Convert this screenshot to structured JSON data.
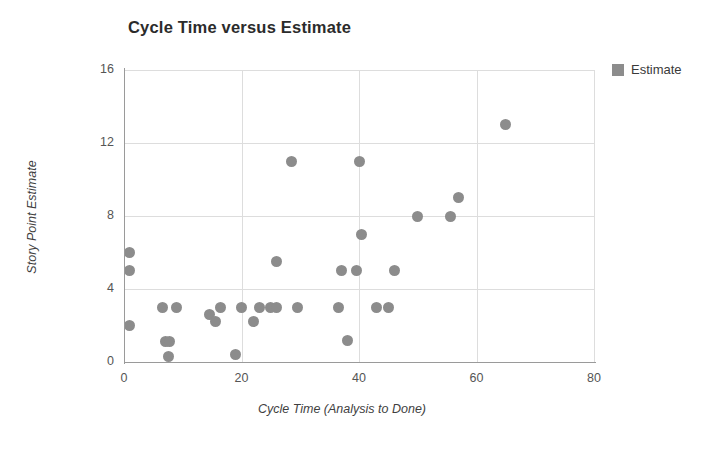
{
  "chart_data": {
    "type": "scatter",
    "title": "Cycle Time versus Estimate",
    "xlabel": "Cycle Time (Analysis to Done)",
    "ylabel": "Story Point Estimate",
    "xlim": [
      0,
      80
    ],
    "ylim": [
      0,
      16
    ],
    "xticks": [
      0,
      20,
      40,
      60,
      80
    ],
    "yticks": [
      0,
      4,
      8,
      12,
      16
    ],
    "grid": true,
    "legend": {
      "position": "top-right-outside",
      "entries": [
        {
          "name": "Estimate",
          "color": "#8c8c8c",
          "marker": "circle"
        }
      ]
    },
    "series": [
      {
        "name": "Estimate",
        "color": "#8c8c8c",
        "points": [
          {
            "x": 1,
            "y": 6
          },
          {
            "x": 1,
            "y": 5
          },
          {
            "x": 1,
            "y": 2
          },
          {
            "x": 6.5,
            "y": 3
          },
          {
            "x": 7,
            "y": 1.1
          },
          {
            "x": 7.8,
            "y": 1.1
          },
          {
            "x": 7.5,
            "y": 0.3
          },
          {
            "x": 9,
            "y": 3
          },
          {
            "x": 14.5,
            "y": 2.6
          },
          {
            "x": 15.5,
            "y": 2.2
          },
          {
            "x": 16.5,
            "y": 3
          },
          {
            "x": 19,
            "y": 0.4
          },
          {
            "x": 20,
            "y": 3
          },
          {
            "x": 22,
            "y": 2.2
          },
          {
            "x": 23,
            "y": 3
          },
          {
            "x": 25,
            "y": 3
          },
          {
            "x": 26,
            "y": 3
          },
          {
            "x": 26,
            "y": 5.5
          },
          {
            "x": 28.5,
            "y": 11
          },
          {
            "x": 29.5,
            "y": 3
          },
          {
            "x": 36.5,
            "y": 3
          },
          {
            "x": 37,
            "y": 5
          },
          {
            "x": 38,
            "y": 1.2
          },
          {
            "x": 39.5,
            "y": 5
          },
          {
            "x": 40,
            "y": 11
          },
          {
            "x": 40.5,
            "y": 7
          },
          {
            "x": 43,
            "y": 3
          },
          {
            "x": 45,
            "y": 3
          },
          {
            "x": 46,
            "y": 5
          },
          {
            "x": 50,
            "y": 8
          },
          {
            "x": 55.5,
            "y": 8
          },
          {
            "x": 57,
            "y": 9
          },
          {
            "x": 65,
            "y": 13
          }
        ]
      }
    ]
  }
}
